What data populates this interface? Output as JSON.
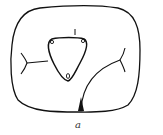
{
  "figure": {
    "caption": "a",
    "stroke_color": "#111111",
    "background": "#ffffff"
  },
  "diagram": {
    "outer_boundary": "rounded-square",
    "inner_shape": "rounded-triangle",
    "inner_label_top": "l",
    "branches": [
      "left-y-junction",
      "right-y-junction",
      "bottom-curve-to-right"
    ]
  }
}
